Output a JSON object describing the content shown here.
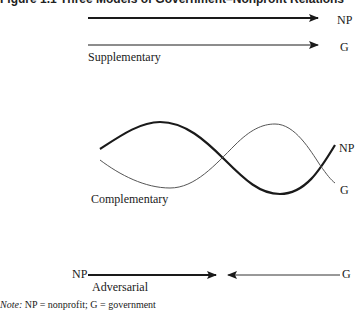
{
  "figure": {
    "title": "Figure 1.1 Three Models of Government–Nonprofit Relations",
    "supplementary": {
      "label": "Supplementary",
      "np_label": "NP",
      "g_label": "G"
    },
    "complementary": {
      "label": "Complementary",
      "np_label": "NP",
      "g_label": "G"
    },
    "adversarial": {
      "label": "Adversarial",
      "np_label": "NP",
      "g_label": "G"
    },
    "note": {
      "prefix": "Note:",
      "text": " NP = nonprofit; G = government"
    }
  },
  "colors": {
    "line": "#1a1a1a",
    "thin_line": "#555555"
  }
}
